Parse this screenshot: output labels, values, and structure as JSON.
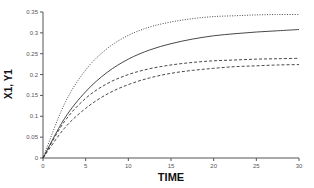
{
  "chart_data": {
    "type": "line",
    "title": "",
    "xlabel": "TIME",
    "ylabel": "X1, Y1",
    "xlim": [
      0,
      30
    ],
    "ylim": [
      0,
      0.35
    ],
    "grid": false,
    "legend": null,
    "x_ticks": [
      "0",
      "5",
      "10",
      "15",
      "20",
      "25",
      "30"
    ],
    "y_ticks": [
      "0",
      "0.05",
      "0.1",
      "0.15",
      "0.2",
      "0.25",
      "0.3",
      "0.35"
    ],
    "x": [
      0,
      2.5,
      5,
      7.5,
      10,
      12.5,
      15,
      17.5,
      20,
      22.5,
      25,
      27.5,
      30
    ],
    "series": [
      {
        "name": "dotted",
        "style": "dotted",
        "values": [
          0,
          0.129,
          0.211,
          0.262,
          0.294,
          0.314,
          0.326,
          0.334,
          0.339,
          0.341,
          0.343,
          0.344,
          0.344
        ]
      },
      {
        "name": "solid",
        "style": "solid",
        "values": [
          0,
          0.094,
          0.159,
          0.205,
          0.237,
          0.259,
          0.274,
          0.285,
          0.293,
          0.298,
          0.302,
          0.305,
          0.308
        ]
      },
      {
        "name": "dashed-upper",
        "style": "dashed",
        "values": [
          0,
          0.087,
          0.143,
          0.178,
          0.2,
          0.214,
          0.223,
          0.229,
          0.233,
          0.235,
          0.237,
          0.238,
          0.239
        ]
      },
      {
        "name": "dashed-lower",
        "style": "dashed",
        "values": [
          0,
          0.071,
          0.119,
          0.153,
          0.176,
          0.192,
          0.203,
          0.21,
          0.215,
          0.219,
          0.221,
          0.223,
          0.224
        ]
      }
    ]
  },
  "colors": {
    "axis": "#555555",
    "line": "#333333"
  }
}
